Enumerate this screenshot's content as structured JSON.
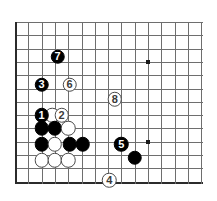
{
  "board": {
    "kind": "go-board-diagram",
    "size_label": "partial 15x13 view of 19x19 board",
    "cols": 15,
    "rows": 13,
    "origin_x": 15,
    "origin_y": 22,
    "spacing": 13.3,
    "line_color": "#6e6e6e",
    "edge_color": "#2b2b2b",
    "background": "#ffffff",
    "black_color": "#000000",
    "white_color": "#ffffff",
    "hoshi": [
      {
        "col": 10,
        "row": 3
      },
      {
        "col": 10,
        "row": 9
      }
    ]
  },
  "chart_data": {
    "type": "scatter",
    "title": "",
    "xlabel": "",
    "ylabel": "",
    "stones": [
      {
        "label": "1",
        "color": "black",
        "col": 2,
        "row": 7
      },
      {
        "label": "2",
        "color": "white",
        "col": 3.5,
        "row": 7
      },
      {
        "label": "3",
        "color": "black",
        "col": 2,
        "row": 4.7
      },
      {
        "label": "4",
        "color": "white",
        "col": 7.1,
        "row": 11.9
      },
      {
        "label": "5",
        "color": "black",
        "col": 8,
        "row": 9.2
      },
      {
        "label": "6",
        "color": "white",
        "col": 4.1,
        "row": 4.7
      },
      {
        "label": "7",
        "color": "black",
        "col": 3.2,
        "row": 2.6
      },
      {
        "label": "8",
        "color": "white",
        "col": 7.5,
        "row": 5.8
      }
    ],
    "plain_stones": [
      {
        "color": "white",
        "col": 2.8,
        "row": 7
      },
      {
        "color": "black",
        "col": 2,
        "row": 8
      },
      {
        "color": "black",
        "col": 3,
        "row": 8
      },
      {
        "color": "white",
        "col": 4,
        "row": 8
      },
      {
        "color": "black",
        "col": 2,
        "row": 9.2
      },
      {
        "color": "white",
        "col": 3,
        "row": 9.2
      },
      {
        "color": "black",
        "col": 4.1,
        "row": 9.2
      },
      {
        "color": "black",
        "col": 5.1,
        "row": 9.2
      },
      {
        "color": "white",
        "col": 2,
        "row": 10.4
      },
      {
        "color": "white",
        "col": 3,
        "row": 10.4
      },
      {
        "color": "white",
        "col": 4,
        "row": 10.4
      },
      {
        "color": "black",
        "col": 9,
        "row": 10.2
      }
    ]
  }
}
